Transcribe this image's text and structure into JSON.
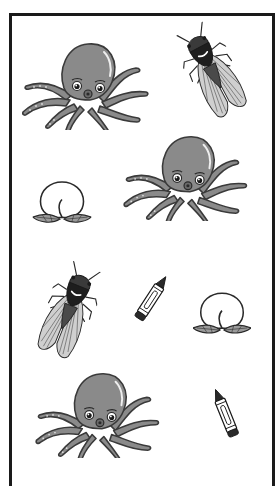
{
  "worksheet": {
    "title": "Picture sorting worksheet",
    "colors": {
      "frame": "#1a1a1a",
      "octopus_fill": "#8a8a8a",
      "octopus_outline": "#3a3a3a",
      "cicada_dark": "#2a2a2a",
      "wing_fill": "#c8c8c8",
      "leaf_fill": "#9a9a9a",
      "crayon_tip": "#2a2a2a"
    },
    "items": [
      {
        "id": "octopus-1",
        "type": "octopus",
        "label": "octopus"
      },
      {
        "id": "cicada-1",
        "type": "cicada",
        "label": "cicada"
      },
      {
        "id": "octopus-2",
        "type": "octopus",
        "label": "octopus"
      },
      {
        "id": "peach-1",
        "type": "peach",
        "label": "peach"
      },
      {
        "id": "cicada-2",
        "type": "cicada",
        "label": "cicada"
      },
      {
        "id": "crayon-1",
        "type": "crayon",
        "label": "crayon"
      },
      {
        "id": "peach-2",
        "type": "peach",
        "label": "peach"
      },
      {
        "id": "octopus-3",
        "type": "octopus",
        "label": "octopus"
      },
      {
        "id": "crayon-2",
        "type": "crayon",
        "label": "crayon"
      }
    ]
  }
}
